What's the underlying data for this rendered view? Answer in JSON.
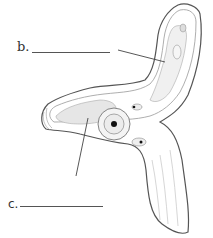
{
  "diagram": {
    "type": "anatomical cross-section worksheet",
    "labels": [
      {
        "id": "b",
        "text": "b.",
        "blank": true
      },
      {
        "id": "c",
        "text": "c.",
        "blank": true
      }
    ],
    "colors": {
      "outline": "#555555",
      "inner_outline": "#999999",
      "stipple_fill": "#e6e6e6",
      "core": "#111111",
      "background": "#ffffff"
    }
  }
}
